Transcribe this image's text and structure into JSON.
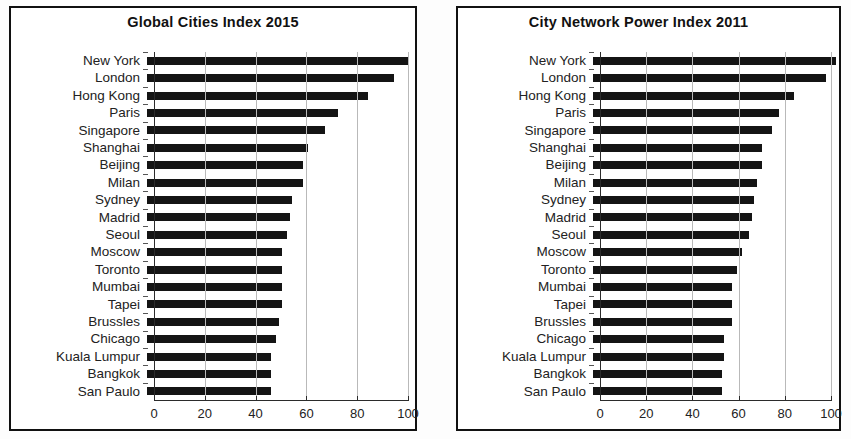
{
  "charts": [
    {
      "title": "Global Cities Index 2015",
      "xticks": [
        0,
        20,
        40,
        60,
        80,
        100
      ],
      "xlim": [
        0,
        100
      ],
      "categories": [
        "New York",
        "London",
        "Hong Kong",
        "Paris",
        "Singapore",
        "Shanghai",
        "Beijing",
        "Milan",
        "Sydney",
        "Madrid",
        "Seoul",
        "Moscow",
        "Toronto",
        "Mumbai",
        "Tapei",
        "Brussles",
        "Chicago",
        "Kuala Lumpur",
        "Bangkok",
        "San Paulo"
      ],
      "values": [
        97,
        92,
        82,
        71,
        66,
        60,
        58,
        58,
        54,
        53,
        52,
        50,
        50,
        50,
        50,
        49,
        48,
        46,
        46,
        46
      ]
    },
    {
      "title": "City Network Power Index 2011",
      "xticks": [
        0,
        20,
        40,
        60,
        80,
        100
      ],
      "xlim": [
        0,
        100
      ],
      "categories": [
        "New York",
        "London",
        "Hong Kong",
        "Paris",
        "Singapore",
        "Shanghai",
        "Beijing",
        "Milan",
        "Sydney",
        "Madrid",
        "Seoul",
        "Moscow",
        "Toronto",
        "Mumbai",
        "Tapei",
        "Brussles",
        "Chicago",
        "Kuala Lumpur",
        "Bangkok",
        "San Paulo"
      ],
      "values": [
        98,
        94,
        81,
        75,
        72,
        68,
        68,
        66,
        65,
        64,
        63,
        60,
        58,
        56,
        56,
        56,
        53,
        53,
        52,
        52
      ]
    }
  ],
  "chart_data": [
    {
      "type": "bar",
      "orientation": "horizontal",
      "title": "Global Cities Index 2015",
      "xlabel": "",
      "ylabel": "",
      "xlim": [
        0,
        100
      ],
      "xticks": [
        0,
        20,
        40,
        60,
        80,
        100
      ],
      "grid": "vertical",
      "legend": "none",
      "bar_color": "#141414",
      "categories": [
        "New York",
        "London",
        "Hong Kong",
        "Paris",
        "Singapore",
        "Shanghai",
        "Beijing",
        "Milan",
        "Sydney",
        "Madrid",
        "Seoul",
        "Moscow",
        "Toronto",
        "Mumbai",
        "Tapei",
        "Brussles",
        "Chicago",
        "Kuala Lumpur",
        "Bangkok",
        "San Paulo"
      ],
      "values": [
        97,
        92,
        82,
        71,
        66,
        60,
        58,
        58,
        54,
        53,
        52,
        50,
        50,
        50,
        50,
        49,
        48,
        46,
        46,
        46
      ]
    },
    {
      "type": "bar",
      "orientation": "horizontal",
      "title": "City Network Power Index 2011",
      "xlabel": "",
      "ylabel": "",
      "xlim": [
        0,
        100
      ],
      "xticks": [
        0,
        20,
        40,
        60,
        80,
        100
      ],
      "grid": "vertical",
      "legend": "none",
      "bar_color": "#141414",
      "categories": [
        "New York",
        "London",
        "Hong Kong",
        "Paris",
        "Singapore",
        "Shanghai",
        "Beijing",
        "Milan",
        "Sydney",
        "Madrid",
        "Seoul",
        "Moscow",
        "Toronto",
        "Mumbai",
        "Tapei",
        "Brussles",
        "Chicago",
        "Kuala Lumpur",
        "Bangkok",
        "San Paulo"
      ],
      "values": [
        98,
        94,
        81,
        75,
        72,
        68,
        68,
        66,
        65,
        64,
        63,
        60,
        58,
        56,
        56,
        56,
        53,
        53,
        52,
        52
      ]
    }
  ]
}
